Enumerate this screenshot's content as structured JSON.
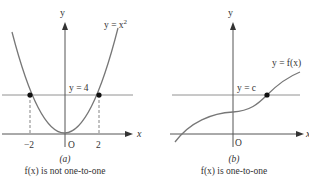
{
  "figure": {
    "panels": [
      {
        "id": "a",
        "panel_label": "(a)",
        "caption": "f(x) is not one-to-one",
        "axis_x_label": "x",
        "axis_y_label": "y",
        "origin_label": "O",
        "curve_label": "y = x",
        "curve_label_exp": "2",
        "line_label": "y = 4",
        "tick_labels": [
          "−2",
          "2"
        ],
        "intersection_points": [
          [
            -2,
            4
          ],
          [
            2,
            4
          ]
        ]
      },
      {
        "id": "b",
        "panel_label": "(b)",
        "caption": "f(x) is one-to-one",
        "axis_x_label": "x",
        "axis_y_label": "y",
        "origin_label": "O",
        "curve_label": "y = f(x)",
        "line_label": "y = c",
        "intersection_points": [
          [
            1,
            "c"
          ]
        ]
      }
    ],
    "colors": {
      "curve": "#777777",
      "axis": "#555555",
      "point": "#111111",
      "text": "#333333"
    }
  }
}
